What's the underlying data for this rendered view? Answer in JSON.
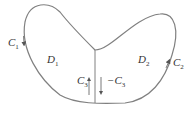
{
  "diagram": {
    "type": "region-decomposition",
    "colors": {
      "stroke": "#808080",
      "text": "#333333",
      "background": "#ffffff"
    },
    "curves": [
      {
        "id": "C1",
        "label": "C",
        "subscript": "1",
        "direction": "counterclockwise-arrow-down-left"
      },
      {
        "id": "C2",
        "label": "C",
        "subscript": "2",
        "direction": "arrow-up-right"
      },
      {
        "id": "C3",
        "label": "C",
        "subscript": "3",
        "direction": "up"
      },
      {
        "id": "-C3",
        "label": "−C",
        "subscript": "3",
        "direction": "down"
      }
    ],
    "regions": [
      {
        "id": "D1",
        "label": "D",
        "subscript": "1"
      },
      {
        "id": "D2",
        "label": "D",
        "subscript": "2"
      }
    ]
  }
}
